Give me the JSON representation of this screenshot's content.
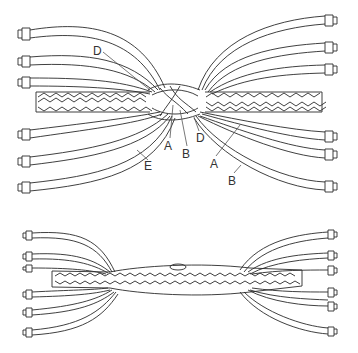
{
  "figure_top": {
    "description": "Splice in progress: braided rope core with strands unlaid and taped at ends, fanning out left and right",
    "labels": [
      {
        "text": "D",
        "x": 97,
        "y": 55,
        "tx": 150,
        "ty": 90
      },
      {
        "text": "E",
        "x": 144,
        "y": 170,
        "tx": 137,
        "ty": 150
      },
      {
        "text": "A",
        "x": 166,
        "y": 149,
        "tx": 173,
        "ty": 105
      },
      {
        "text": "B",
        "x": 184,
        "y": 157,
        "tx": 180,
        "ty": 110
      },
      {
        "text": "D",
        "x": 197,
        "y": 142,
        "tx": 194,
        "ty": 117
      },
      {
        "text": "A",
        "x": 212,
        "y": 167,
        "tx": 240,
        "ty": 125
      },
      {
        "text": "B",
        "x": 230,
        "y": 184,
        "tx": 241,
        "ty": 165
      }
    ]
  },
  "figure_bottom": {
    "description": "Completed splice: braided bury section with strand ends tapered and taped"
  },
  "colors": {
    "line": "#2a2a2a",
    "background": "#ffffff"
  }
}
